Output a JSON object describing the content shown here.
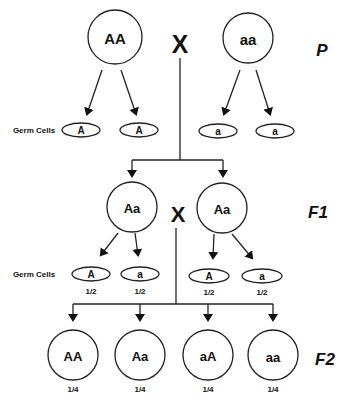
{
  "parents": {
    "generation_label": "P",
    "cross_symbol": "X",
    "left": {
      "genotype": "AA"
    },
    "right": {
      "genotype": "aa"
    },
    "germ_cells_label": "Germ Cells",
    "gametes": [
      {
        "allele": "A"
      },
      {
        "allele": "A"
      },
      {
        "allele": "a"
      },
      {
        "allele": "a"
      }
    ]
  },
  "f1": {
    "generation_label": "F1",
    "cross_symbol": "X",
    "left": {
      "genotype": "Aa"
    },
    "right": {
      "genotype": "Aa"
    },
    "germ_cells_label": "Germ Cells",
    "gametes": [
      {
        "allele": "A",
        "probability": "1/2"
      },
      {
        "allele": "a",
        "probability": "1/2"
      },
      {
        "allele": "A",
        "probability": "1/2"
      },
      {
        "allele": "a",
        "probability": "1/2"
      }
    ]
  },
  "f2": {
    "generation_label": "F2",
    "offspring": [
      {
        "genotype": "AA",
        "probability": "1/4"
      },
      {
        "genotype": "Aa",
        "probability": "1/4"
      },
      {
        "genotype": "aA",
        "probability": "1/4"
      },
      {
        "genotype": "aa",
        "probability": "1/4"
      }
    ]
  }
}
